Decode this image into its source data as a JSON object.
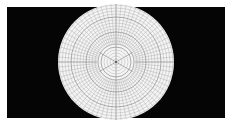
{
  "diagram": {
    "type": "polar-grid",
    "background_color": "#ffffff",
    "panel_color": "#050505",
    "disc_color": "#f4f4f4",
    "line_color": "#9a9a9a",
    "accent_line_color": "#777777",
    "panel": {
      "x": 7,
      "y": 7,
      "width": 218,
      "height": 111
    },
    "disc": {
      "cx": 116,
      "cy": 62,
      "r": 58
    },
    "inner_radial_spokes": 6,
    "outer_radial_spokes": 72,
    "inner_zone_radius": 19,
    "ring_spacing": 3
  }
}
